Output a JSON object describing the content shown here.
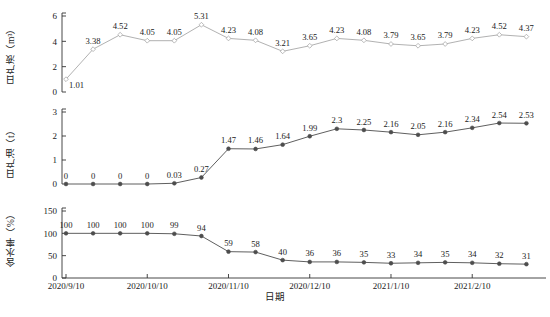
{
  "chart_data": {
    "type": "line",
    "title": "",
    "xlabel": "日期",
    "grid": false,
    "legend": "none",
    "x_tick_labels": [
      "2020/9/10",
      "2020/10/10",
      "2020/11/10",
      "2020/12/10",
      "2021/1/10",
      "2021/2/10"
    ],
    "x_tick_indices": [
      0,
      3,
      6,
      9,
      12,
      15
    ],
    "categories": [
      "2020/9/10",
      "2020/9/20",
      "2020/9/30",
      "2020/10/10",
      "2020/10/20",
      "2020/10/30",
      "2020/11/10",
      "2020/11/20",
      "2020/11/30",
      "2020/12/10",
      "2020/12/20",
      "2020/12/30",
      "2021/1/10",
      "2021/1/20",
      "2021/1/30",
      "2021/2/10",
      "2021/2/20",
      "2021/2/28",
      "2021/3/10"
    ],
    "panels": [
      {
        "id": "liquid",
        "ylabel": "日产液（m³）",
        "ylim": [
          0,
          6
        ],
        "yticks": [
          0,
          2,
          4,
          6
        ],
        "ytick_labels": [
          "0",
          "2",
          "4",
          "6"
        ],
        "color": "#a8a8a8",
        "marker": "diamond-open",
        "values": [
          1.01,
          3.38,
          4.52,
          4.05,
          4.05,
          5.31,
          4.23,
          4.08,
          3.21,
          3.65,
          4.23,
          4.08,
          3.79,
          3.65,
          3.79,
          4.23,
          4.52,
          4.37
        ],
        "point_labels": [
          "1.01",
          "3.38",
          "4.52",
          "4.05",
          "4.05",
          "5.31",
          "4.23",
          "4.08",
          "3.21",
          "3.65",
          "4.23",
          "4.08",
          "3.79",
          "3.65",
          "3.79",
          "4.23",
          "4.52",
          "4.37"
        ]
      },
      {
        "id": "oil",
        "ylabel": "日产油（t）",
        "ylim": [
          0,
          3
        ],
        "yticks": [
          0,
          1,
          2,
          3
        ],
        "ytick_labels": [
          "0",
          "1",
          "2",
          "3"
        ],
        "color": "#4d4d4d",
        "marker": "circle-filled",
        "values": [
          0,
          0,
          0,
          0,
          0.03,
          0.27,
          1.47,
          1.46,
          1.64,
          1.99,
          2.3,
          2.25,
          2.16,
          2.05,
          2.16,
          2.34,
          2.54,
          2.53
        ],
        "point_labels": [
          "0",
          "0",
          "0",
          "0",
          "0.03",
          "0.27",
          "1.47",
          "1.46",
          "1.64",
          "1.99",
          "2.3",
          "2.25",
          "2.16",
          "2.05",
          "2.16",
          "2.34",
          "2.54",
          "2.53"
        ]
      },
      {
        "id": "water",
        "ylabel": "含水率（%）",
        "ylim": [
          0,
          150
        ],
        "yticks": [
          0,
          50,
          100,
          150
        ],
        "ytick_labels": [
          "0",
          "50",
          "100",
          "150"
        ],
        "color": "#4d4d4d",
        "marker": "circle-filled",
        "values": [
          100,
          100,
          100,
          100,
          99,
          94,
          59,
          58,
          40,
          36,
          36,
          35,
          33,
          34,
          35,
          34,
          32,
          31
        ],
        "point_labels": [
          "100",
          "100",
          "100",
          "100",
          "99",
          "94",
          "59",
          "58",
          "40",
          "36",
          "36",
          "35",
          "33",
          "34",
          "35",
          "34",
          "32",
          "31"
        ]
      }
    ]
  },
  "axes": {
    "x_title": "日期"
  }
}
